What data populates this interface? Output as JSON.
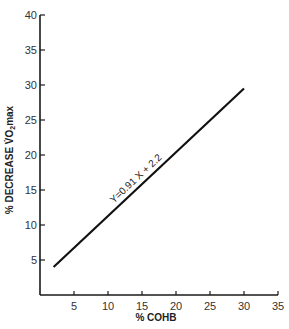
{
  "chart_data": {
    "type": "line",
    "title": "",
    "xlabel": "% COHB",
    "ylabel_main": "% DECREASE V̇O",
    "ylabel_sub": "2",
    "ylabel_tail": "max",
    "xlim": [
      0,
      35
    ],
    "ylim": [
      0,
      40
    ],
    "x_ticks": [
      5,
      10,
      15,
      20,
      25,
      30,
      35
    ],
    "y_ticks": [
      5,
      10,
      15,
      20,
      25,
      30,
      35,
      40
    ],
    "grid": false,
    "series": [
      {
        "name": "regression",
        "x": [
          2,
          30
        ],
        "y": [
          4.0,
          29.5
        ]
      }
    ],
    "annotation": {
      "text": "Y=0.91 X + 2.2",
      "x": 15,
      "y": 15.85
    }
  }
}
